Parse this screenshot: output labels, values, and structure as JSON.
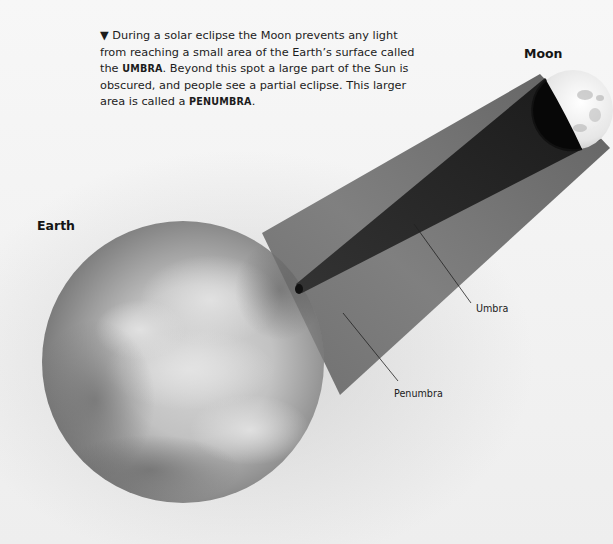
{
  "caption": {
    "marker": "▼",
    "lines": {
      "part1": "During a solar eclipse the Moon prevents any light from reaching a small area of the Earth’s surface called the ",
      "term1": "UMBRA",
      "part2": ". Beyond this spot a large part of the Sun is obscured, and people see a partial eclipse. This larger area is called a ",
      "term2": "PENUMBRA",
      "part3": "."
    }
  },
  "labels": {
    "moon": "Moon",
    "earth": "Earth",
    "umbra": "Umbra",
    "penumbra": "Penumbra"
  },
  "colors": {
    "background": "#f4f4f4",
    "penumbra": "#6e6e6e",
    "umbra": "#2a2a2a",
    "moon_dark": "#0a0a0a",
    "moon_lit": "#f0f0f0",
    "earth_base": "#9a9a9a",
    "earth_highlight": "#d6d6d6",
    "text": "#1c1c1c"
  }
}
